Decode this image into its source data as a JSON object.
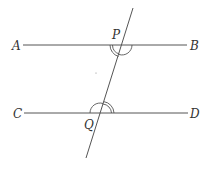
{
  "diagram": {
    "colors": {
      "line": "#555555",
      "label": "#333333",
      "background": "#ffffff"
    },
    "points": {
      "A": {
        "label": "A"
      },
      "B": {
        "label": "B"
      },
      "C": {
        "label": "C"
      },
      "D": {
        "label": "D"
      },
      "P": {
        "label": "P"
      },
      "Q": {
        "label": "Q"
      }
    },
    "lines": [
      {
        "name": "AB",
        "from": "A",
        "to": "B"
      },
      {
        "name": "CD",
        "from": "C",
        "to": "D"
      },
      {
        "name": "transversal",
        "through": [
          "P",
          "Q"
        ]
      }
    ],
    "angle_marks": [
      {
        "at": "P",
        "position": "below-left",
        "type": "double-arc"
      },
      {
        "at": "P",
        "position": "below-right",
        "type": "single-arc"
      },
      {
        "at": "Q",
        "position": "above-right",
        "type": "double-arc"
      },
      {
        "at": "Q",
        "position": "above-left",
        "type": "single-arc"
      }
    ]
  }
}
